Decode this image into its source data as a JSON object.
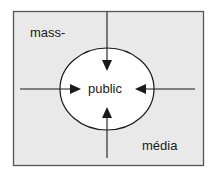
{
  "diagram": {
    "labels": {
      "top_left": "mass-",
      "center": "public",
      "bottom_right": "média"
    },
    "colors": {
      "background": "#e9e9e9",
      "border": "#555555",
      "ellipse_fill": "#ffffff",
      "stroke": "#1a1a1a"
    },
    "arrows": [
      {
        "from": "top",
        "to": "public"
      },
      {
        "from": "left",
        "to": "public"
      },
      {
        "from": "right",
        "to": "public"
      },
      {
        "from": "bottom",
        "to": "public"
      }
    ]
  }
}
